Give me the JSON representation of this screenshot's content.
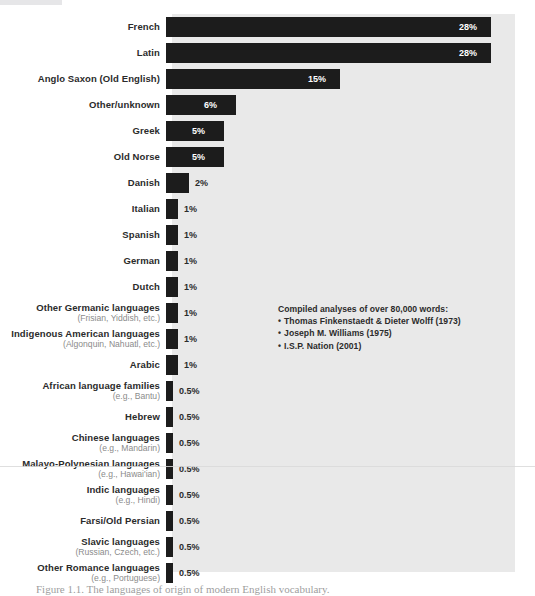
{
  "chart_data": {
    "type": "bar",
    "orientation": "horizontal",
    "title": "",
    "xlabel": "",
    "ylabel": "",
    "xlim": [
      0,
      28
    ],
    "grid": false,
    "legend": false,
    "categories": [
      "French",
      "Latin",
      "Anglo Saxon (Old English)",
      "Other/unknown",
      "Greek",
      "Old Norse",
      "Danish",
      "Italian",
      "Spanish",
      "German",
      "Dutch",
      "Other Germanic languages",
      "Indigenous American languages",
      "Arabic",
      "African language families",
      "Hebrew",
      "Chinese languages",
      "Malayo-Polynesian languages",
      "Indic languages",
      "Farsi/Old Persian",
      "Slavic languages",
      "Other Romance languages"
    ],
    "sublabels": [
      "",
      "",
      "",
      "",
      "",
      "",
      "",
      "",
      "",
      "",
      "",
      "(Frisian, Yiddish, etc.)",
      "(Algonquin, Nahuatl, etc.)",
      "",
      "(e.g., Bantu)",
      "",
      "(e.g., Mandarin)",
      "(e.g., Hawai'ian)",
      "(e.g., Hindi)",
      "",
      "(Russian, Czech, etc.)",
      "(e.g., Portuguese)"
    ],
    "values": [
      28,
      28,
      15,
      6,
      5,
      5,
      2,
      1,
      1,
      1,
      1,
      1,
      1,
      1,
      0.5,
      0.5,
      0.5,
      0.5,
      0.5,
      0.5,
      0.5,
      0.5
    ],
    "value_labels": [
      "28%",
      "28%",
      "15%",
      "6%",
      "5%",
      "5%",
      "2%",
      "1%",
      "1%",
      "1%",
      "1%",
      "1%",
      "1%",
      "1%",
      "0.5%",
      "0.5%",
      "0.5%",
      "0.5%",
      "0.5%",
      "0.5%",
      "0.5%",
      "0.5%"
    ],
    "annotation": {
      "heading": "Compiled analyses of over 80,000 words:",
      "items": [
        "Thomas Finkenstaedt & Dieter Wolff (1973)",
        "Joseph M. Williams (1975)",
        "I.S.P. Nation (2001)"
      ]
    },
    "colors": {
      "bar": "#1c1c1c",
      "panel": "#e9e9e9",
      "label": "#2b2b2b",
      "sublabel": "#8b8b8b",
      "value_inside": "#ffffff",
      "value_outside": "#2b2b2b",
      "background": "#ffffff"
    }
  },
  "caption": "Figure 1.1. The languages of origin of modern English vocabulary."
}
